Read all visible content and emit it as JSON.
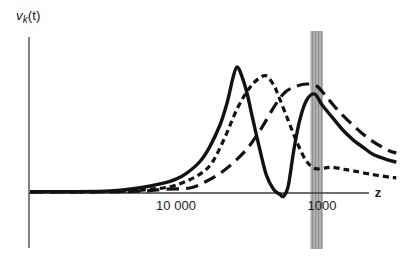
{
  "figure": {
    "background_color": "#ffffff",
    "ink_color": "#121212",
    "axis_color": "#3f3f3f",
    "text_color": "#1c1c1c",
    "band_base_color": "#b2b2b2",
    "band_stripe_color": "#8f8f8f"
  },
  "labels": {
    "y_axis_main": "v",
    "y_axis_sub": "k",
    "y_axis_rest": "(t)",
    "x_axis": "z"
  },
  "chart_data": {
    "type": "line",
    "title": "",
    "xlabel": "z",
    "ylabel": "v_k(t)",
    "x_axis": {
      "scale": "log",
      "direction": "z decreases to the right",
      "range": [
        100000,
        300
      ],
      "ticks": [
        {
          "label": "10 000",
          "value": 10000
        },
        {
          "label": "1000",
          "value": 1000
        }
      ]
    },
    "y_axis": {
      "label": "v_k(t)",
      "units": "arbitrary (no ticks shown)",
      "range": [
        -0.05,
        1.05
      ]
    },
    "band": {
      "name": "vertical-gray-band",
      "z_from": 1200,
      "z_to": 985
    },
    "grid": false,
    "legend": false,
    "series": [
      {
        "name": "solid",
        "style": "solid",
        "points": [
          [
            100000,
            0.01
          ],
          [
            30000,
            0.015
          ],
          [
            18000,
            0.04
          ],
          [
            12000,
            0.08
          ],
          [
            10000,
            0.11
          ],
          [
            8400,
            0.16
          ],
          [
            6850,
            0.25
          ],
          [
            5850,
            0.37
          ],
          [
            5000,
            0.54
          ],
          [
            4480,
            0.71
          ],
          [
            4100,
            0.9
          ],
          [
            3830,
            1.0
          ],
          [
            3550,
            0.93
          ],
          [
            3260,
            0.79
          ],
          [
            2970,
            0.58
          ],
          [
            2660,
            0.34
          ],
          [
            2400,
            0.14
          ],
          [
            2150,
            0.03
          ],
          [
            1950,
            -0.01
          ],
          [
            1830,
            -0.025
          ],
          [
            1700,
            0.06
          ],
          [
            1560,
            0.34
          ],
          [
            1420,
            0.58
          ],
          [
            1270,
            0.74
          ],
          [
            1120,
            0.785
          ],
          [
            1000,
            0.7
          ],
          [
            850,
            0.6
          ],
          [
            720,
            0.5
          ],
          [
            610,
            0.42
          ],
          [
            520,
            0.36
          ],
          [
            445,
            0.305
          ],
          [
            360,
            0.265
          ],
          [
            310,
            0.245
          ]
        ]
      },
      {
        "name": "short-dashed",
        "style": "short-dash",
        "points": [
          [
            100000,
            0.008
          ],
          [
            25000,
            0.012
          ],
          [
            15000,
            0.03
          ],
          [
            11000,
            0.05
          ],
          [
            8670,
            0.09
          ],
          [
            6850,
            0.15
          ],
          [
            5670,
            0.24
          ],
          [
            4630,
            0.44
          ],
          [
            3770,
            0.68
          ],
          [
            3110,
            0.84
          ],
          [
            2700,
            0.91
          ],
          [
            2420,
            0.93
          ],
          [
            2150,
            0.86
          ],
          [
            2000,
            0.78
          ],
          [
            1710,
            0.58
          ],
          [
            1480,
            0.4
          ],
          [
            1290,
            0.26
          ],
          [
            1120,
            0.195
          ],
          [
            940,
            0.2
          ],
          [
            850,
            0.205
          ],
          [
            720,
            0.19
          ],
          [
            610,
            0.175
          ],
          [
            470,
            0.15
          ],
          [
            355,
            0.128
          ],
          [
            310,
            0.12
          ]
        ]
      },
      {
        "name": "long-dashed",
        "style": "long-dash",
        "points": [
          [
            100000,
            0.008
          ],
          [
            20000,
            0.012
          ],
          [
            12000,
            0.03
          ],
          [
            8030,
            0.04
          ],
          [
            6140,
            0.095
          ],
          [
            4840,
            0.167
          ],
          [
            3880,
            0.26
          ],
          [
            3160,
            0.37
          ],
          [
            2580,
            0.52
          ],
          [
            2140,
            0.68
          ],
          [
            1790,
            0.8
          ],
          [
            1480,
            0.85
          ],
          [
            1270,
            0.865
          ],
          [
            1090,
            0.85
          ],
          [
            940,
            0.77
          ],
          [
            790,
            0.665
          ],
          [
            643,
            0.56
          ],
          [
            533,
            0.475
          ],
          [
            436,
            0.4
          ],
          [
            353,
            0.34
          ],
          [
            310,
            0.317
          ]
        ]
      }
    ],
    "layout": {
      "x_px_at_z10000": 176,
      "px_per_decade": 146,
      "baseline_y_px": 193,
      "unit_amplitude_px": 126,
      "band_top_px": 31,
      "band_bottom_px": 249,
      "y_axis_x_px": 29,
      "y_axis_top_px": 37,
      "y_axis_bottom_px": 248,
      "x_axis_start_px": 29,
      "x_axis_end_px": 369,
      "tick_baseline_y_px": 210,
      "xlabel_baseline_y_px": 197,
      "xlabel_x_px": 378
    }
  }
}
